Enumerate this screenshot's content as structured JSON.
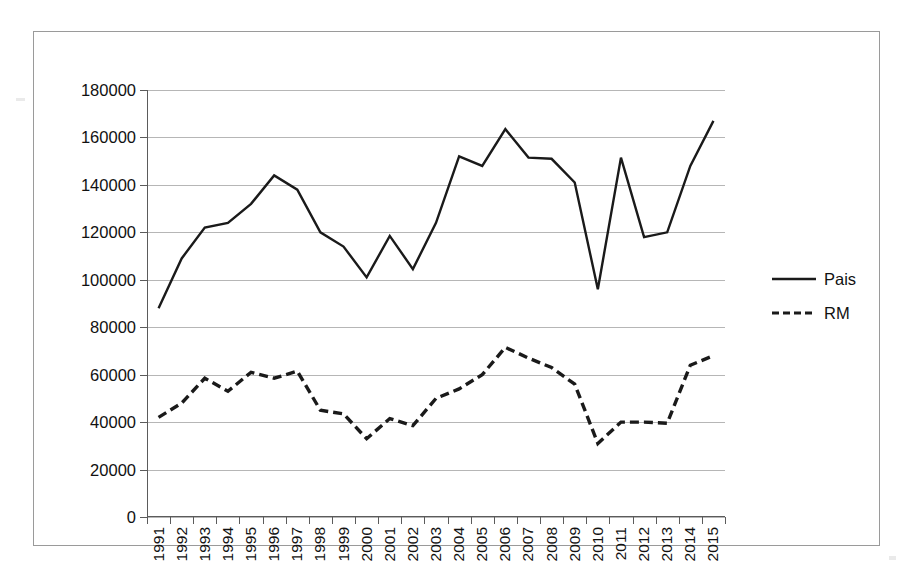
{
  "chart_data": {
    "type": "line",
    "title": "",
    "subtitle": "",
    "xlabel": "",
    "ylabel": "",
    "grid": true,
    "legend_position": "right",
    "ylim": [
      0,
      180000
    ],
    "ytick_labels": [
      "180000",
      "160000",
      "140000",
      "120000",
      "100000",
      "80000",
      "60000",
      "40000",
      "20000",
      "0"
    ],
    "ytick_values": [
      180000,
      160000,
      140000,
      120000,
      100000,
      80000,
      60000,
      40000,
      20000,
      0
    ],
    "categories": [
      "1991",
      "1992",
      "1993",
      "1994",
      "1995",
      "1996",
      "1997",
      "1998",
      "1999",
      "2000",
      "2001",
      "2002",
      "2003",
      "2004",
      "2005",
      "2006",
      "2007",
      "2008",
      "2009",
      "2010",
      "2011",
      "2012",
      "2013",
      "2014",
      "2015"
    ],
    "series": [
      {
        "name": "Pais",
        "style": "solid",
        "color": "#1a1a1a",
        "values": [
          88000,
          109000,
          122000,
          124000,
          132000,
          144000,
          138000,
          120000,
          114000,
          101000,
          118500,
          104500,
          124000,
          152000,
          148000,
          163500,
          151500,
          151000,
          141000,
          96000,
          151500,
          118000,
          120000,
          148000,
          167000
        ]
      },
      {
        "name": "RM",
        "style": "dashed",
        "color": "#1a1a1a",
        "values": [
          42000,
          48000,
          58500,
          53000,
          61000,
          58500,
          61500,
          45000,
          43500,
          33000,
          41500,
          38500,
          50000,
          54000,
          60000,
          71500,
          67000,
          63000,
          56000,
          31000,
          40000,
          40000,
          39500,
          64000,
          68000
        ]
      }
    ]
  },
  "legend": {
    "items": [
      {
        "label": "Pais",
        "style": "solid"
      },
      {
        "label": "RM",
        "style": "dashed"
      }
    ]
  }
}
